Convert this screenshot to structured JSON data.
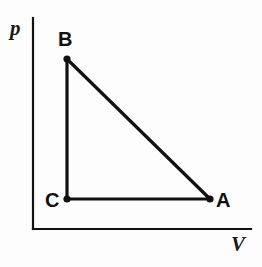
{
  "figure": {
    "background_color": "#fdfdfd",
    "ink_color": "#111111"
  },
  "axes": {
    "y_axis": {
      "label": "p",
      "name": "pressure-axis",
      "x": 33,
      "y_top": 18,
      "y_bottom": 229,
      "stroke_width": 2.2
    },
    "x_axis": {
      "label": "V",
      "name": "volume-axis",
      "y": 229,
      "x_left": 33,
      "x_right": 251,
      "stroke_width": 2.2
    }
  },
  "chart_data": {
    "type": "line",
    "xlabel": "V",
    "ylabel": "p",
    "grid": false,
    "legend": "none",
    "axis_arrows": false,
    "points": [
      {
        "id": "B",
        "label": "B",
        "x": 67,
        "y": 59,
        "label_dx": -9,
        "label_dy": -30
      },
      {
        "id": "C",
        "label": "C",
        "x": 67,
        "y": 199,
        "label_dx": -22,
        "label_dy": -9
      },
      {
        "id": "A",
        "label": "A",
        "x": 210,
        "y": 199,
        "label_dx": 6,
        "label_dy": -9
      }
    ],
    "segments": [
      {
        "id": "BC",
        "from": "B",
        "to": "C",
        "name": "segment-b-c"
      },
      {
        "id": "CA",
        "from": "C",
        "to": "A",
        "name": "segment-c-a"
      },
      {
        "id": "AB",
        "from": "A",
        "to": "B",
        "name": "segment-a-b"
      }
    ],
    "marker_radius": 3.6,
    "line_width": 3.2
  }
}
